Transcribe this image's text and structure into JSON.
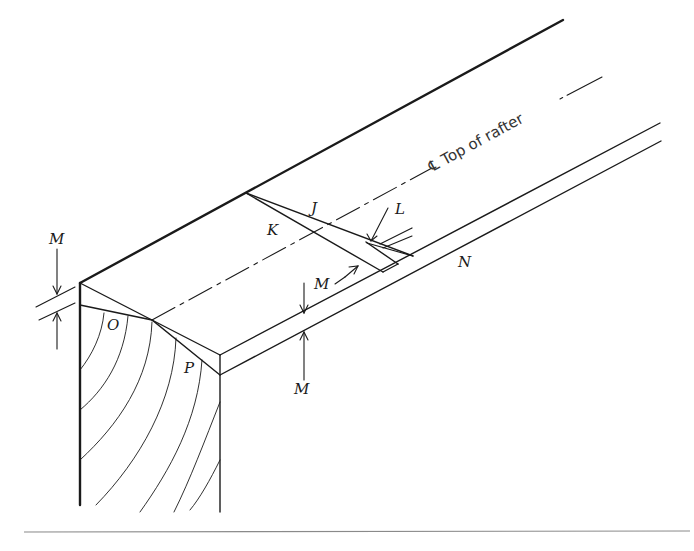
{
  "diagram": {
    "type": "isometric technical drawing of rafter/beam end with chamfer and centerline",
    "centerline_label": "℄ Top of rafter",
    "labels": {
      "J": "J",
      "K": "K",
      "L": "L",
      "M_left": "M",
      "M_mid": "M",
      "M_edge_top": "M",
      "M_edge_bottom": "M",
      "N": "N",
      "O": "O",
      "P": "P"
    },
    "colors": {
      "line": "#1a1a1a",
      "rule": "#8a8a8a",
      "background": "#ffffff"
    }
  }
}
